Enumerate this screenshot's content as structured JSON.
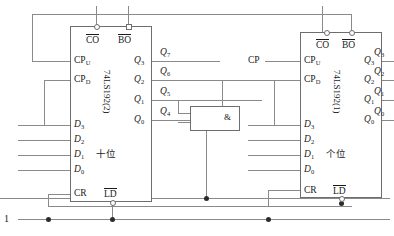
{
  "diagram": {
    "wire_color": "#8a8a8a",
    "ink_color": "#1a1a1a"
  },
  "source": {
    "label": "1"
  },
  "clock": {
    "label": "CP"
  },
  "gate": {
    "symbol": "&",
    "name": "and-gate"
  },
  "chips": [
    {
      "id": "tens",
      "part": "74LS192(2)",
      "digit_label": "十位",
      "top_pins": [
        {
          "name": "CO",
          "overline": true,
          "marker": "circle"
        },
        {
          "name": "BO",
          "overline": true,
          "marker": "square"
        }
      ],
      "left_pins": [
        {
          "name": "CP",
          "sub": "U"
        },
        {
          "name": "CP",
          "sub": "D"
        },
        {
          "name": "D",
          "sub": "3",
          "italic": true
        },
        {
          "name": "D",
          "sub": "2",
          "italic": true
        },
        {
          "name": "D",
          "sub": "1",
          "italic": true
        },
        {
          "name": "D",
          "sub": "0",
          "italic": true
        },
        {
          "name": "CR",
          "sub": ""
        }
      ],
      "bottom_pins": [
        {
          "name": "LD",
          "overline": true,
          "marker": "circle"
        }
      ],
      "right_pins": [
        {
          "name": "Q",
          "sub": "3",
          "italic": true
        },
        {
          "name": "Q",
          "sub": "2",
          "italic": true
        },
        {
          "name": "Q",
          "sub": "1",
          "italic": true
        },
        {
          "name": "Q",
          "sub": "0",
          "italic": true
        }
      ],
      "bus_labels": [
        {
          "name": "Q",
          "sub": "7",
          "italic": true
        },
        {
          "name": "Q",
          "sub": "6",
          "italic": true
        },
        {
          "name": "Q",
          "sub": "5",
          "italic": true
        },
        {
          "name": "Q",
          "sub": "4",
          "italic": true
        }
      ]
    },
    {
      "id": "ones",
      "part": "74LS192(1)",
      "digit_label": "个位",
      "top_pins": [
        {
          "name": "CO",
          "overline": true,
          "marker": "circle"
        },
        {
          "name": "BO",
          "overline": true,
          "marker": "circle"
        }
      ],
      "left_pins": [
        {
          "name": "CP",
          "sub": "U"
        },
        {
          "name": "CP",
          "sub": "D"
        },
        {
          "name": "D",
          "sub": "3",
          "italic": true
        },
        {
          "name": "D",
          "sub": "2",
          "italic": true
        },
        {
          "name": "D",
          "sub": "1",
          "italic": true
        },
        {
          "name": "D",
          "sub": "0",
          "italic": true
        },
        {
          "name": "CR",
          "sub": ""
        }
      ],
      "bottom_pins": [
        {
          "name": "LD",
          "overline": true,
          "marker": "circle"
        }
      ],
      "right_pins": [
        {
          "name": "Q",
          "sub": "3",
          "italic": true
        },
        {
          "name": "Q",
          "sub": "2",
          "italic": true
        },
        {
          "name": "Q",
          "sub": "1",
          "italic": true
        },
        {
          "name": "Q",
          "sub": "0",
          "italic": true
        }
      ],
      "bus_labels": [
        {
          "name": "Q",
          "sub": "3",
          "italic": true
        },
        {
          "name": "Q",
          "sub": "2",
          "italic": true
        },
        {
          "name": "Q",
          "sub": "1",
          "italic": true
        },
        {
          "name": "Q",
          "sub": "0",
          "italic": true
        }
      ]
    }
  ]
}
